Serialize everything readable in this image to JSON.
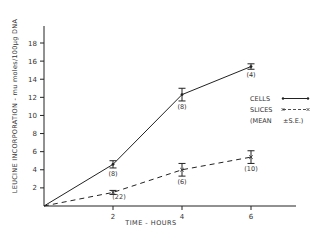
{
  "chart_data": {
    "type": "line",
    "title": "",
    "xlabel": "TIME - HOURS",
    "ylabel": "LEUCINE INCORPORATION - mu moles/100µg DNA",
    "xlim": [
      0,
      6.7
    ],
    "ylim": [
      0,
      20
    ],
    "x_ticks": [
      2,
      4,
      6
    ],
    "y_ticks": [
      2,
      4,
      6,
      8,
      10,
      12,
      14,
      16,
      18
    ],
    "grid": false,
    "legend_position": "right",
    "series": [
      {
        "name": "CELLS",
        "style": "solid",
        "x": [
          0,
          2,
          4,
          6
        ],
        "values": [
          0,
          4.6,
          12.3,
          15.4
        ],
        "se": [
          0,
          0.4,
          0.7,
          0.3
        ],
        "n_labels": [
          "",
          "(8)",
          "(8)",
          "(4)"
        ]
      },
      {
        "name": "SLICES",
        "style": "dashed",
        "x": [
          0,
          2,
          4,
          6
        ],
        "values": [
          0,
          1.5,
          4.0,
          5.4
        ],
        "se": [
          0,
          0.15,
          0.7,
          0.7
        ],
        "n_labels": [
          "",
          "(22)",
          "(6)",
          "(10)"
        ]
      }
    ],
    "legend": [
      {
        "label": "CELLS",
        "marker": "solid"
      },
      {
        "label": "SLICES",
        "marker": "dashed-x"
      },
      {
        "label": "(MEAN",
        "marker": "±S.E.)"
      }
    ]
  }
}
